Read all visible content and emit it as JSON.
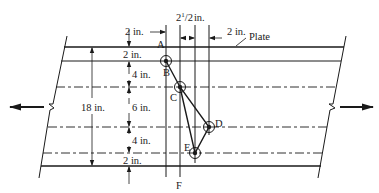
{
  "figure": {
    "plate_label": "Plate",
    "total_width_label": "18 in.",
    "horizontal_dims": {
      "edge_to_A": "2 in.",
      "pitch": "2",
      "pitch_sup": "1",
      "pitch_frac": "/2",
      "pitch_unit": "in.",
      "last": "2 in."
    },
    "vertical_dims": [
      "2 in.",
      "4 in.",
      "6 in.",
      "4 in.",
      "2 in."
    ],
    "points": {
      "A": "A",
      "B": "B",
      "C": "C",
      "D": "D",
      "E": "E",
      "F": "F"
    },
    "colors": {
      "ink": "#1a1a1a",
      "background": "#ffffff"
    }
  }
}
